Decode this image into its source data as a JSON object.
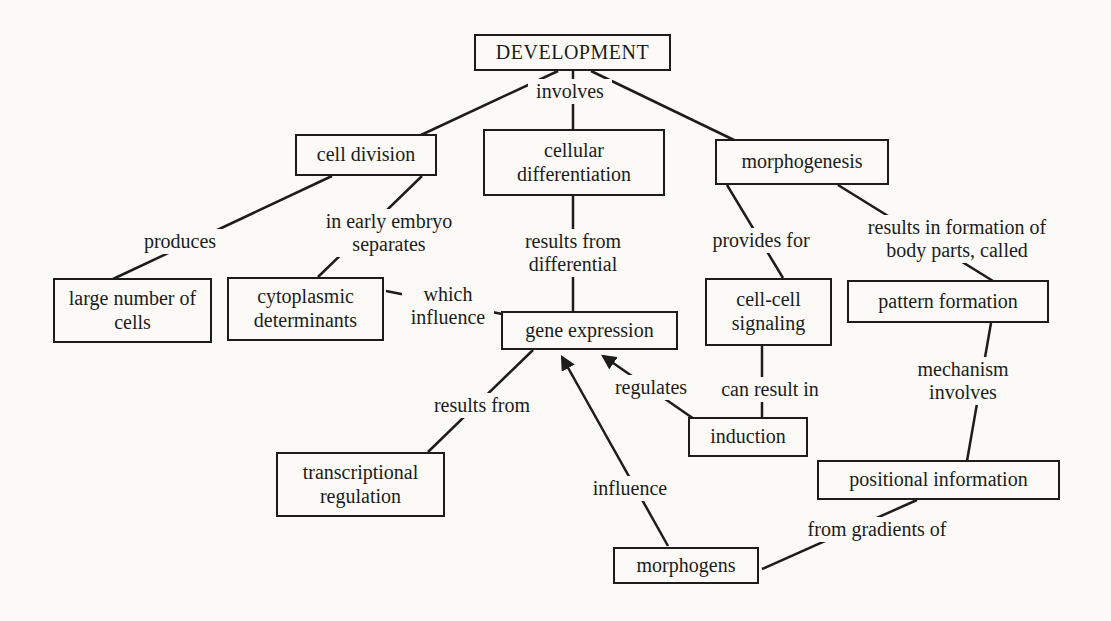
{
  "colors": {
    "background": "#fbfaf7",
    "ink": "#1c1c1a"
  },
  "diagram": {
    "type": "concept-map",
    "topic": "DEVELOPMENT"
  },
  "nodes": {
    "development": "DEVELOPMENT",
    "cell_division": "cell division",
    "cellular_differentiation": "cellular differentiation",
    "morphogenesis": "morphogenesis",
    "large_number_of_cells": "large number of cells",
    "cytoplasmic_determinants": "cytoplasmic determinants",
    "gene_expression": "gene expression",
    "cell_cell_signaling": "cell-cell signaling",
    "pattern_formation": "pattern formation",
    "induction": "induction",
    "positional_information": "positional information",
    "transcriptional_regulation": "transcriptional regulation",
    "morphogens": "morphogens"
  },
  "edge_labels": {
    "involves": "involves",
    "produces": "produces",
    "in_early_embryo_separates": "in early embryo separates",
    "results_from_differential": "results from differential",
    "provides_for": "provides for",
    "results_in_formation": "results in formation of body parts, called",
    "which_influence": "which influence",
    "results_from": "results from",
    "regulates": "regulates",
    "can_result_in": "can result in",
    "mechanism_involves": "mechanism involves",
    "influence": "influence",
    "from_gradients_of": "from gradients of"
  }
}
